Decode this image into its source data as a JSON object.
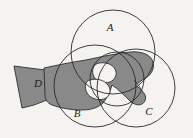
{
  "figure": {
    "background_color": "#f6f5f2",
    "width": 193,
    "height": 138
  },
  "style": {
    "hand_fill": "#8a8a8a",
    "hand_stroke": "#2f2f2f",
    "circle_stroke": "#2a2a2a",
    "label_color": "#1c1c1c"
  },
  "labels": [
    {
      "id": "A",
      "text": "A",
      "x": 110,
      "y": 28
    },
    {
      "id": "B",
      "text": "B",
      "x": 77,
      "y": 114
    },
    {
      "id": "C",
      "text": "C",
      "x": 149,
      "y": 112
    },
    {
      "id": "D",
      "text": "D",
      "x": 38,
      "y": 84
    }
  ],
  "circles": [
    {
      "id": "circle-a",
      "cx": 113,
      "cy": 52,
      "r": 42
    },
    {
      "id": "circle-b",
      "cx": 95,
      "cy": 86,
      "r": 41
    },
    {
      "id": "circle-c",
      "cx": 136,
      "cy": 88,
      "r": 39
    },
    {
      "id": "circle-inner",
      "cx": 117,
      "cy": 79,
      "r": 27
    }
  ],
  "hand": {
    "sleeve_path": "M 14,66 L 37,69 L 46,70 L 47,100 L 34,105 L 22,108 Z",
    "body_path": "M 44,70 C 58,66 72,63 86,61 C 100,58 118,54 132,53 C 142,52 150,56 152,62 C 154,69 150,75 144,78 C 141,80 137,82 134,84 C 137,86 141,88 143,90 C 147,94 147,100 143,103 C 139,106 133,105 130,102 C 124,96 118,90 112,86 C 110,92 108,98 104,102 C 99,107 91,109 83,109 C 72,109 60,107 52,104 C 47,102 45,98 45,94 Z",
    "knuckle_notch_path": "M 98,64 C 104,63 110,64 113,68 C 116,72 114,77 110,79 C 105,81 99,80 96,76 C 93,72 94,66 98,64 Z",
    "finger_gap_path": "M 88,78 C 94,76 101,77 105,81 C 109,85 108,92 103,95 C 97,98 90,96 87,91 C 84,86 84,80 88,78 Z"
  }
}
